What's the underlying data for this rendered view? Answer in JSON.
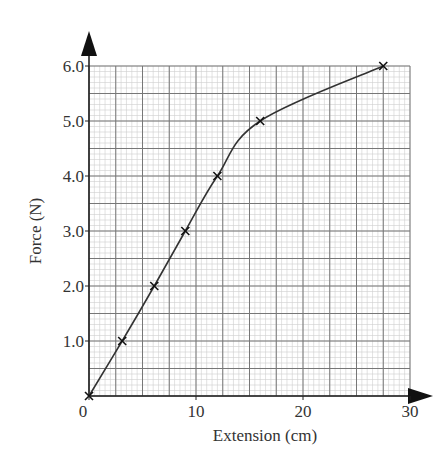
{
  "chart_data": {
    "type": "line",
    "title": "",
    "xlabel": "Extension (cm)",
    "ylabel": "Force (N)",
    "xlim": [
      0,
      30
    ],
    "ylim": [
      0,
      6.0
    ],
    "grid": true,
    "grid_style": "graph-paper",
    "xticks": [
      0,
      10,
      20,
      30
    ],
    "xtick_labels": [
      "0",
      "10",
      "20",
      "30"
    ],
    "yticks": [
      1.0,
      2.0,
      3.0,
      4.0,
      5.0,
      6.0
    ],
    "ytick_labels": [
      "1.0",
      "2.0",
      "3.0",
      "4.0",
      "5.0",
      "6.0"
    ],
    "series": [
      {
        "name": "Force vs Extension",
        "marker": "x",
        "points": [
          {
            "x": 0,
            "y": 0
          },
          {
            "x": 3.1,
            "y": 1.0
          },
          {
            "x": 6.1,
            "y": 2.0
          },
          {
            "x": 9.0,
            "y": 3.0
          },
          {
            "x": 12.0,
            "y": 4.0
          },
          {
            "x": 16.0,
            "y": 5.0
          },
          {
            "x": 27.5,
            "y": 6.0
          }
        ]
      }
    ],
    "colors": {
      "line": "#333333",
      "axis": "#222222",
      "grid_major": "#777777",
      "grid_minor": "#cfcfcf"
    }
  }
}
